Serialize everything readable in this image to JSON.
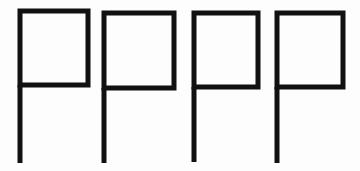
{
  "image": {
    "kind": "handwriting-sample",
    "description": "Four hand-drawn capital letter P glyphs in a horizontal row",
    "width": 360,
    "height": 171,
    "background_color": "#fdfdfd",
    "ink_color": "#111111",
    "glyph_count": 4
  },
  "glyphs": [
    {
      "character": "P",
      "index": 1,
      "name": "glyph-p-1",
      "bowl": {
        "left": 20,
        "top": 11,
        "right": 88,
        "bottom": 85
      },
      "stem": {
        "x": 20,
        "top": 85,
        "bottom": 163
      },
      "stroke_width": 5
    },
    {
      "character": "P",
      "index": 2,
      "name": "glyph-p-2",
      "bowl": {
        "left": 104,
        "top": 13,
        "right": 174,
        "bottom": 88
      },
      "stem": {
        "x": 104,
        "top": 88,
        "bottom": 163
      },
      "stroke_width": 5
    },
    {
      "character": "P",
      "index": 3,
      "name": "glyph-p-3",
      "bowl": {
        "left": 194,
        "top": 13,
        "right": 258,
        "bottom": 87
      },
      "stem": {
        "x": 194,
        "top": 87,
        "bottom": 162
      },
      "stroke_width": 5
    },
    {
      "character": "P",
      "index": 4,
      "name": "glyph-p-4",
      "bowl": {
        "left": 277,
        "top": 13,
        "right": 343,
        "bottom": 87
      },
      "stem": {
        "x": 277,
        "top": 87,
        "bottom": 163
      },
      "stroke_width": 5
    }
  ]
}
